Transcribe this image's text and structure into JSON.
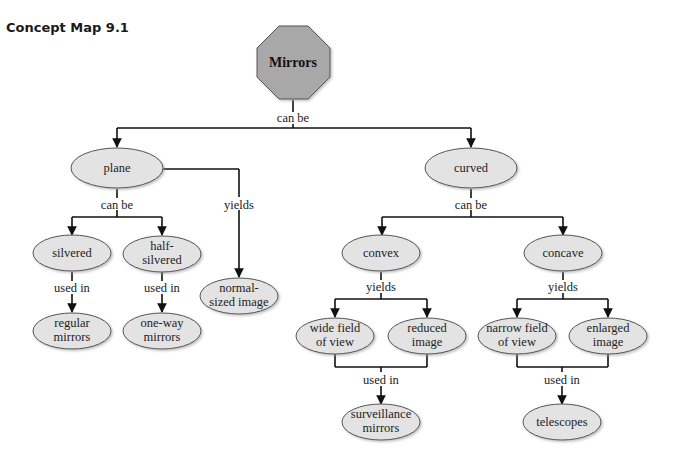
{
  "title": "Concept Map 9.1",
  "colors": {
    "root_fill": "#a8a8a8",
    "node_fill": "#e3e3e3",
    "stroke": "#555555",
    "edge": "#111111"
  },
  "nodes": {
    "mirrors": {
      "lines": [
        "Mirrors"
      ],
      "shape": "octagon"
    },
    "plane": {
      "lines": [
        "plane"
      ],
      "shape": "ellipse"
    },
    "curved": {
      "lines": [
        "curved"
      ],
      "shape": "ellipse"
    },
    "silvered": {
      "lines": [
        "silvered"
      ],
      "shape": "ellipse"
    },
    "half_silvered": {
      "lines": [
        "half-",
        "silvered"
      ],
      "shape": "ellipse"
    },
    "normal_sized_image": {
      "lines": [
        "normal-",
        "sized image"
      ],
      "shape": "ellipse"
    },
    "regular_mirrors": {
      "lines": [
        "regular",
        "mirrors"
      ],
      "shape": "ellipse"
    },
    "one_way_mirrors": {
      "lines": [
        "one-way",
        "mirrors"
      ],
      "shape": "ellipse"
    },
    "convex": {
      "lines": [
        "convex"
      ],
      "shape": "ellipse"
    },
    "concave": {
      "lines": [
        "concave"
      ],
      "shape": "ellipse"
    },
    "wide_field_of_view": {
      "lines": [
        "wide field",
        "of view"
      ],
      "shape": "ellipse"
    },
    "reduced_image": {
      "lines": [
        "reduced",
        "image"
      ],
      "shape": "ellipse"
    },
    "narrow_field_of_view": {
      "lines": [
        "narrow field",
        "of view"
      ],
      "shape": "ellipse"
    },
    "enlarged_image": {
      "lines": [
        "enlarged",
        "image"
      ],
      "shape": "ellipse"
    },
    "surveillance_mirrors": {
      "lines": [
        "surveillance",
        "mirrors"
      ],
      "shape": "ellipse"
    },
    "telescopes": {
      "lines": [
        "telescopes"
      ],
      "shape": "ellipse"
    }
  },
  "links": {
    "mirrors_can_be": "can be",
    "plane_can_be": "can be",
    "plane_yields": "yields",
    "silvered_used_in": "used in",
    "half_silvered_used_in": "used in",
    "curved_can_be": "can be",
    "convex_yields": "yields",
    "concave_yields": "yields",
    "convex_used_in": "used in",
    "concave_used_in": "used in"
  }
}
